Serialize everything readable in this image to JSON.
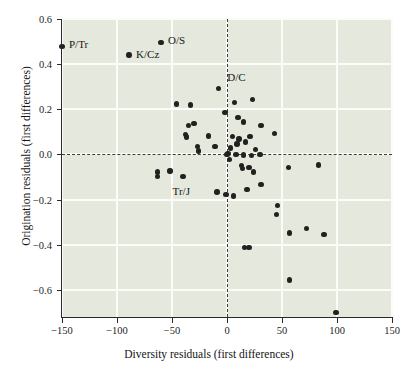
{
  "chart_data": {
    "type": "scatter",
    "title": "",
    "xlabel": "Diversity residuals (first differences)",
    "ylabel": "Origination residuals (first differences)",
    "xlim": [
      -150,
      150
    ],
    "ylim": [
      -0.72,
      0.6
    ],
    "xticks": [
      -150,
      -100,
      -50,
      0,
      50,
      100,
      150
    ],
    "xticklabels": [
      "−150",
      "−100",
      "−50",
      "0",
      "50",
      "100",
      "150"
    ],
    "yticks": [
      0.6,
      0.4,
      0.2,
      0.0,
      -0.2,
      -0.4,
      -0.6
    ],
    "yticklabels": [
      "0.6",
      "0.4",
      "0.2",
      "0.0",
      "−0.2",
      "−0.4",
      "−0.6"
    ],
    "grid": true,
    "grid_color": "#fbfcf8",
    "panel_color": "#e4e8dd",
    "point_color": "#23211f",
    "reference_lines": [
      {
        "axis": "x",
        "value": 0,
        "style": "dashed"
      },
      {
        "axis": "y",
        "value": 0,
        "style": "dashed"
      }
    ],
    "annotations": [
      {
        "text": "P/Tr",
        "x": -150,
        "y": 0.479,
        "dx": 7,
        "dy": -1
      },
      {
        "text": "O/S",
        "x": -60,
        "y": 0.497,
        "dx": 7,
        "dy": -1
      },
      {
        "text": "K/Cz",
        "x": -89,
        "y": 0.441,
        "dx": 7,
        "dy": 0
      },
      {
        "text": "D/C",
        "x": -8,
        "y": 0.293,
        "dx": 9,
        "dy": -10
      },
      {
        "text": "Tr/J",
        "x": -44,
        "y": -0.098,
        "dx": -6,
        "dy": 15
      }
    ],
    "points": [
      {
        "x": -150,
        "y": 0.479
      },
      {
        "x": -89,
        "y": 0.441
      },
      {
        "x": -60,
        "y": 0.497
      },
      {
        "x": -8,
        "y": 0.293
      },
      {
        "x": -46,
        "y": 0.224
      },
      {
        "x": -33,
        "y": 0.219
      },
      {
        "x": 7,
        "y": 0.231
      },
      {
        "x": 23,
        "y": 0.244
      },
      {
        "x": -2,
        "y": 0.186
      },
      {
        "x": 10,
        "y": 0.165
      },
      {
        "x": 15,
        "y": 0.143
      },
      {
        "x": -30,
        "y": 0.137
      },
      {
        "x": -35,
        "y": 0.127
      },
      {
        "x": 31,
        "y": 0.128
      },
      {
        "x": -38,
        "y": 0.088
      },
      {
        "x": -37,
        "y": 0.077
      },
      {
        "x": -17,
        "y": 0.082
      },
      {
        "x": 5,
        "y": 0.079
      },
      {
        "x": 11,
        "y": 0.069
      },
      {
        "x": 21,
        "y": 0.079
      },
      {
        "x": 43,
        "y": 0.094
      },
      {
        "x": -27,
        "y": 0.036
      },
      {
        "x": -26,
        "y": 0.015
      },
      {
        "x": -11,
        "y": 0.035
      },
      {
        "x": 3,
        "y": 0.028
      },
      {
        "x": 9,
        "y": 0.047
      },
      {
        "x": 17,
        "y": 0.055
      },
      {
        "x": 26,
        "y": 0.021
      },
      {
        "x": 1,
        "y": 0.004
      },
      {
        "x": 0,
        "y": 0.001
      },
      {
        "x": 8,
        "y": 0.0
      },
      {
        "x": 15,
        "y": -0.002
      },
      {
        "x": 22,
        "y": -0.004
      },
      {
        "x": 30,
        "y": 0.0
      },
      {
        "x": 2,
        "y": -0.021
      },
      {
        "x": 13,
        "y": -0.049
      },
      {
        "x": 14,
        "y": -0.061
      },
      {
        "x": 20,
        "y": -0.057
      },
      {
        "x": 24,
        "y": -0.077
      },
      {
        "x": 56,
        "y": -0.058
      },
      {
        "x": 83,
        "y": -0.046
      },
      {
        "x": -63,
        "y": -0.078
      },
      {
        "x": -63,
        "y": -0.097
      },
      {
        "x": -52,
        "y": -0.074
      },
      {
        "x": -40,
        "y": -0.098
      },
      {
        "x": 31,
        "y": -0.134
      },
      {
        "x": 18,
        "y": -0.154
      },
      {
        "x": -9,
        "y": -0.166
      },
      {
        "x": -1,
        "y": -0.176
      },
      {
        "x": 6,
        "y": -0.184
      },
      {
        "x": 46,
        "y": -0.226
      },
      {
        "x": 45,
        "y": -0.265
      },
      {
        "x": 57,
        "y": -0.348
      },
      {
        "x": 72,
        "y": -0.327
      },
      {
        "x": 88,
        "y": -0.354
      },
      {
        "x": 16,
        "y": -0.412
      },
      {
        "x": 20,
        "y": -0.412
      },
      {
        "x": 57,
        "y": -0.556
      },
      {
        "x": 99,
        "y": -0.7
      }
    ]
  }
}
